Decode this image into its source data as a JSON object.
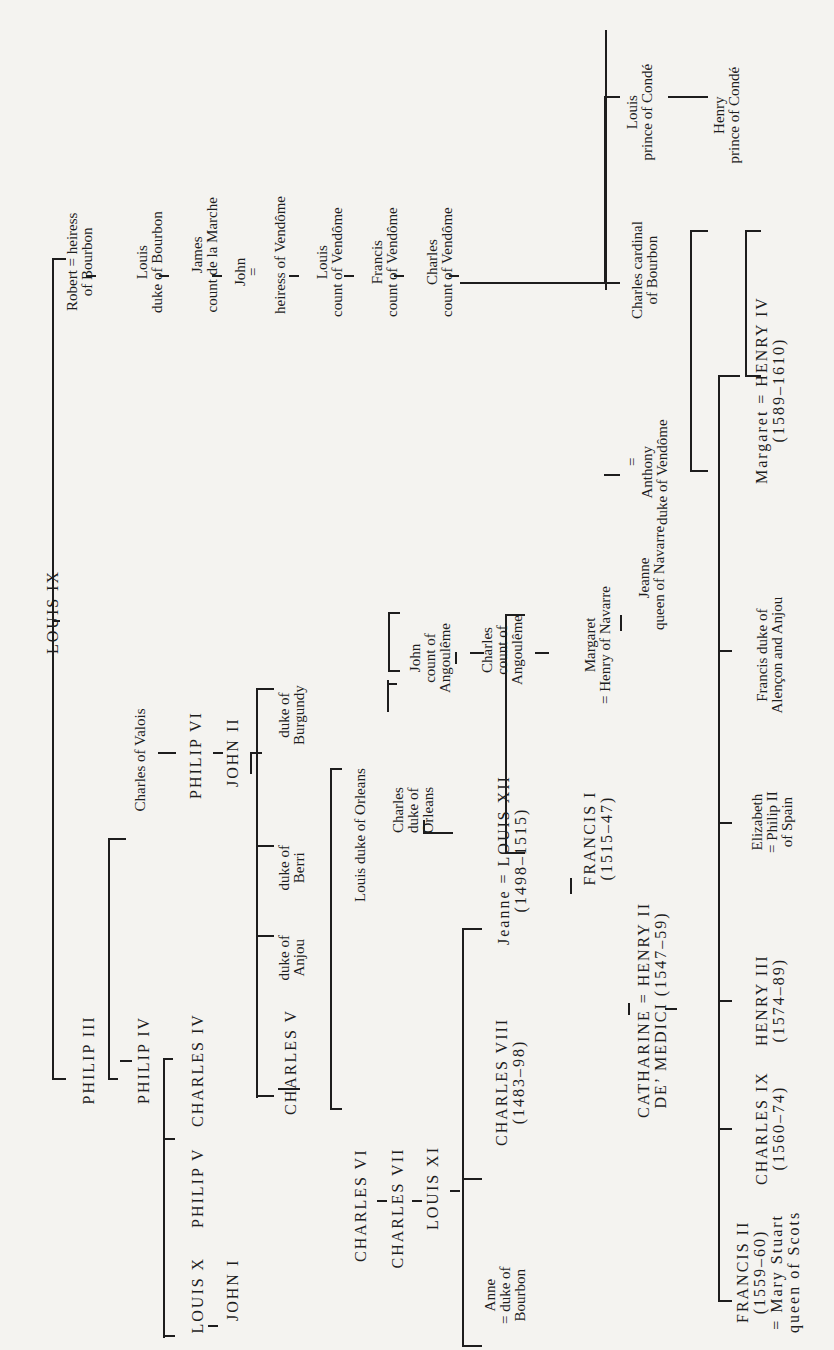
{
  "diagram": {
    "orientation": "rotated-90-ccw",
    "nodes": {
      "louis_ix": [
        "LOUIS IX"
      ],
      "philip_iii": [
        "PHILIP III"
      ],
      "philip_iv": [
        "PHILIP IV"
      ],
      "louis_x": [
        "LOUIS X"
      ],
      "philip_v": [
        "PHILIP V"
      ],
      "charles_iv": [
        "CHARLES IV"
      ],
      "john_i": [
        "JOHN I"
      ],
      "charles_valois": [
        "Charles of Valois"
      ],
      "philip_vi": [
        "PHILIP VI"
      ],
      "john_ii": [
        "JOHN II"
      ],
      "charles_v": [
        "CHARLES V"
      ],
      "duke_anjou": [
        "duke of",
        "Anjou"
      ],
      "duke_berri": [
        "duke of",
        "Berri"
      ],
      "duke_burgundy": [
        "duke of",
        "Burgundy"
      ],
      "charles_vi": [
        "CHARLES VI"
      ],
      "charles_vii": [
        "CHARLES VII"
      ],
      "louis_xi": [
        "LOUIS XI"
      ],
      "louis_orleans": [
        "Louis duke of Orleans"
      ],
      "charles_orleans": [
        "Charles",
        "duke of",
        "Orleans"
      ],
      "john_angouleme": [
        "John",
        "count of",
        "Angoulême"
      ],
      "charles_angouleme": [
        "Charles",
        "count of",
        "Angoulême"
      ],
      "anne": [
        "Anne",
        "= duke of",
        "Bourbon"
      ],
      "charles_viii": [
        "CHARLES VIII",
        "(1483–98)"
      ],
      "jeanne_louis_xii": [
        "Jeanne = LOUIS XII",
        "(1498–1515)"
      ],
      "francis_i": [
        "FRANCIS I",
        "(1515–47)"
      ],
      "margaret_navarre": [
        "Margaret",
        "= Henry of Navarre"
      ],
      "jeanne_navarre": [
        "Jeanne",
        "queen of Navarre"
      ],
      "marriage_eq": [
        "="
      ],
      "anthony": [
        "Anthony",
        "duke of Vendôme"
      ],
      "catharine_henry_ii": [
        "CATHARINE = HENRY II",
        "DE’ MEDICI       (1547–59)"
      ],
      "francis_ii": [
        "FRANCIS II",
        "(1559–60)",
        "= Mary Stuart",
        "queen of Scots"
      ],
      "charles_ix": [
        "CHARLES IX",
        "(1560–74)"
      ],
      "henry_iii": [
        "HENRY III",
        "(1574–89)"
      ],
      "elizabeth": [
        "Elizabeth",
        "= Philip II",
        "of Spain"
      ],
      "francis_alencon": [
        "Francis duke of",
        "Alençon and Anjou"
      ],
      "margaret_henry_iv": [
        "Margaret = HENRY IV",
        "(1589–1610)"
      ],
      "robert": [
        "Robert = heiress",
        "of Bourbon"
      ],
      "louis_bourbon": [
        "Louis",
        "duke of Bourbon"
      ],
      "james_marche": [
        "James",
        "count de la Marche"
      ],
      "john_bourbon": [
        "John"
      ],
      "john_eq": [
        "="
      ],
      "heiress_vendome": [
        "heiress of Vendôme"
      ],
      "louis_vendome": [
        "Louis",
        "count of Vendôme"
      ],
      "francis_vendome": [
        "Francis",
        "count of Vendôme"
      ],
      "charles_vendome": [
        "Charles",
        "count of Vendôme"
      ],
      "charles_cardinal": [
        "Charles cardinal",
        "of Bourbon"
      ],
      "louis_conde": [
        "Louis",
        "prince of Condé"
      ],
      "henry_conde": [
        "Henry",
        "prince of Condé"
      ]
    },
    "colors": {
      "ink": "#1d1d1d",
      "paper": "#f4f3f0"
    }
  }
}
